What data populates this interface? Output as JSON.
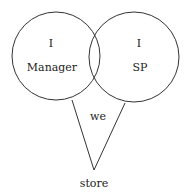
{
  "diagram": {
    "left_circle": {
      "line1": "I",
      "line2": "Manager"
    },
    "right_circle": {
      "line1": "I",
      "line2": "SP"
    },
    "overlap_region": {
      "label": "we"
    },
    "apex": {
      "label": "store"
    }
  }
}
